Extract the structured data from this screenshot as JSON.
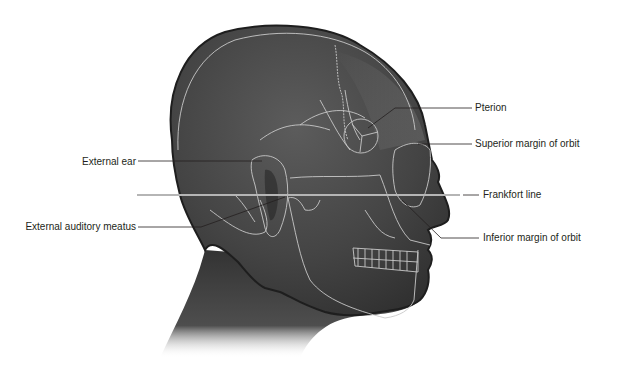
{
  "figure": {
    "labels": {
      "left": [
        {
          "id": "external-ear",
          "text": "External ear"
        },
        {
          "id": "external-auditory-meatus",
          "text": "External auditory meatus"
        }
      ],
      "right": [
        {
          "id": "pterion",
          "text": "Pterion"
        },
        {
          "id": "superior-margin-of-orbit",
          "text": "Superior margin of orbit"
        },
        {
          "id": "frankfort-line",
          "text": "Frankfort line"
        },
        {
          "id": "inferior-margin-of-orbit",
          "text": "Inferior margin of orbit"
        }
      ]
    },
    "colors": {
      "skin": "#4a4a4a",
      "skin_dark": "#2e2e2e",
      "bone_lines": "#c8c8c8",
      "frankfort_line": "#b5b5b5",
      "leader": "#231f20",
      "text": "#231f20"
    }
  }
}
